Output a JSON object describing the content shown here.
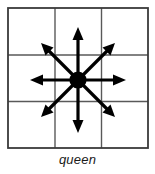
{
  "figure": {
    "caption": "queen",
    "title": "queen",
    "kind": "chess-move-diagram"
  },
  "colors": {
    "background": "#ffffff",
    "grid_line": "#4d4d4d",
    "grid_border": "#333333",
    "arrow": "#000000",
    "dot": "#000000",
    "caption_text": "#1a1a1a"
  },
  "board": {
    "rows": 3,
    "columns": 3,
    "cell_count": 9,
    "origin_x": 8,
    "origin_y": 8,
    "size": 140,
    "cell_size": 46.5,
    "grid_line_x": [
      55,
      101
    ],
    "grid_line_y": [
      55,
      101
    ],
    "cells": [
      {
        "row": 0,
        "col": 0,
        "reachable": true
      },
      {
        "row": 0,
        "col": 1,
        "reachable": true
      },
      {
        "row": 0,
        "col": 2,
        "reachable": true
      },
      {
        "row": 1,
        "col": 0,
        "reachable": true
      },
      {
        "row": 1,
        "col": 1,
        "reachable": false
      },
      {
        "row": 1,
        "col": 2,
        "reachable": true
      },
      {
        "row": 2,
        "col": 0,
        "reachable": true
      },
      {
        "row": 2,
        "col": 1,
        "reachable": true
      },
      {
        "row": 2,
        "col": 2,
        "reachable": true
      }
    ]
  },
  "piece": {
    "name": "queen",
    "center_x": 78,
    "center_y": 80,
    "radius": 8.5,
    "marker": "filled-circle"
  },
  "moves": {
    "count": 8,
    "description": "eight-direction movement",
    "directions": [
      {
        "name": "north",
        "dx": 0,
        "dy": -1,
        "tip_x": 78,
        "tip_y": 29
      },
      {
        "name": "northeast",
        "dx": 1,
        "dy": -1,
        "tip_x": 112,
        "tip_y": 46
      },
      {
        "name": "east",
        "dx": 1,
        "dy": 0,
        "tip_x": 125,
        "tip_y": 80
      },
      {
        "name": "southeast",
        "dx": 1,
        "dy": 1,
        "tip_x": 112,
        "tip_y": 113
      },
      {
        "name": "south",
        "dx": 0,
        "dy": 1,
        "tip_x": 78,
        "tip_y": 131
      },
      {
        "name": "southwest",
        "dx": -1,
        "dy": 1,
        "tip_x": 45,
        "tip_y": 113
      },
      {
        "name": "west",
        "dx": -1,
        "dy": 0,
        "tip_x": 32,
        "tip_y": 80
      },
      {
        "name": "northwest",
        "dx": -1,
        "dy": -1,
        "tip_x": 45,
        "tip_y": 46
      }
    ]
  }
}
